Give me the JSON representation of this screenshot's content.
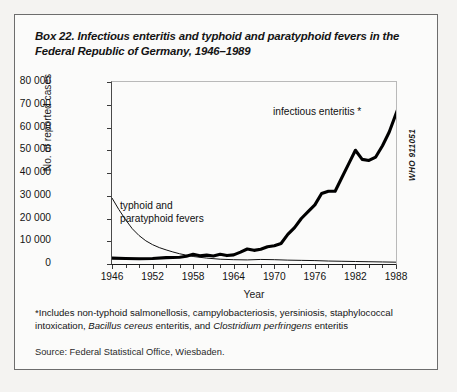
{
  "box": {
    "title": "Box 22. Infectious enteritis and typhoid and paratyphoid fevers in the Federal Republic of Germany, 1946–1989",
    "who_code": "WHO 911051",
    "footnote_marker": "*",
    "footnote_part1": "Includes non-typhoid salmonellosis, campylobacteriosis, yersiniosis, staphylococcal intoxication, ",
    "footnote_italic1": "Bacillus cereus",
    "footnote_part2": " enteritis, and ",
    "footnote_italic2": "Clostridium perfringens",
    "footnote_part3": " enteritis",
    "source": "Source: Federal Statistical Office, Wiesbaden."
  },
  "chart_data": {
    "type": "line",
    "title": "Box 22. Infectious enteritis and typhoid and paratyphoid fevers in the Federal Republic of Germany, 1946–1989",
    "xlabel": "Year",
    "ylabel": "No. of reported cases",
    "xlim": [
      1946,
      1988
    ],
    "ylim": [
      0,
      80000
    ],
    "xticks": [
      1946,
      1952,
      1958,
      1964,
      1970,
      1976,
      1982,
      1988
    ],
    "xtick_labels": [
      "1946",
      "1952",
      "1958",
      "1964",
      "1970",
      "1976",
      "1982",
      "1988"
    ],
    "minor_tick_interval": 2,
    "yticks": [
      0,
      10000,
      20000,
      30000,
      40000,
      50000,
      60000,
      70000,
      80000
    ],
    "ytick_labels": [
      "0",
      "10 000",
      "20 000",
      "30 000",
      "40 000",
      "50 000",
      "60 000",
      "70 000",
      "80 000"
    ],
    "grid": false,
    "legend": "annotations",
    "annotations": [
      {
        "text": "infectious enteritis *",
        "x": 1974,
        "y": 62000
      },
      {
        "text": "typhoid and paratyphoid fevers",
        "x": 1951,
        "y": 26000
      }
    ],
    "x": [
      1946,
      1948,
      1950,
      1952,
      1954,
      1956,
      1958,
      1960,
      1962,
      1964,
      1966,
      1968,
      1970,
      1972,
      1974,
      1976,
      1978,
      1980,
      1982,
      1984,
      1986,
      1988
    ],
    "series": [
      {
        "name": "infectious enteritis *",
        "style": "thick-black",
        "values": [
          2500,
          2400,
          2300,
          2600,
          3000,
          4500,
          6200,
          4500,
          5200,
          4200,
          6000,
          8000,
          7500,
          12000,
          17000,
          26000,
          32000,
          33000,
          45000,
          47000,
          41000,
          43000
        ]
      },
      {
        "name": "typhoid and paratyphoid fevers",
        "style": "thin-black",
        "values": [
          29000,
          19000,
          12500,
          8500,
          6000,
          4200,
          3000,
          2200,
          1800,
          1500,
          1300,
          1500,
          1400,
          1300,
          1200,
          1100,
          1000,
          900,
          800,
          700,
          600,
          500
        ]
      }
    ],
    "enteritis_detail_x": [
      1946,
      1948,
      1950,
      1952,
      1954,
      1956,
      1957,
      1958,
      1959,
      1960,
      1961,
      1962,
      1963,
      1964,
      1965,
      1966,
      1967,
      1968,
      1969,
      1970,
      1971,
      1972,
      1973,
      1974,
      1975,
      1976,
      1977,
      1978,
      1979,
      1980,
      1981,
      1982,
      1983,
      1984,
      1985,
      1986,
      1987,
      1988,
      1989
    ],
    "enteritis_detail_y": [
      2600,
      2400,
      2300,
      2400,
      2800,
      3000,
      3400,
      4300,
      3600,
      3900,
      3500,
      4300,
      3700,
      4000,
      5200,
      6600,
      6000,
      6500,
      7600,
      8000,
      9000,
      13000,
      16000,
      20000,
      23000,
      26000,
      31000,
      32000,
      32000,
      38000,
      44000,
      50000,
      46000,
      45500,
      47000,
      52000,
      58000,
      66000,
      74000
    ],
    "typhoid_detail_x": [
      1946,
      1947,
      1948,
      1949,
      1950,
      1951,
      1952,
      1953,
      1954,
      1955,
      1956,
      1957,
      1958,
      1960,
      1962,
      1964,
      1966,
      1968,
      1970,
      1972,
      1974,
      1976,
      1978,
      1980,
      1982,
      1984,
      1986,
      1988,
      1989
    ],
    "typhoid_detail_y": [
      29000,
      24000,
      19500,
      15500,
      12500,
      10200,
      8500,
      7200,
      6200,
      5300,
      4500,
      3900,
      3300,
      2600,
      2100,
      1900,
      1800,
      2000,
      1900,
      1700,
      1600,
      1500,
      1300,
      1200,
      1100,
      1000,
      900,
      800,
      700
    ]
  }
}
